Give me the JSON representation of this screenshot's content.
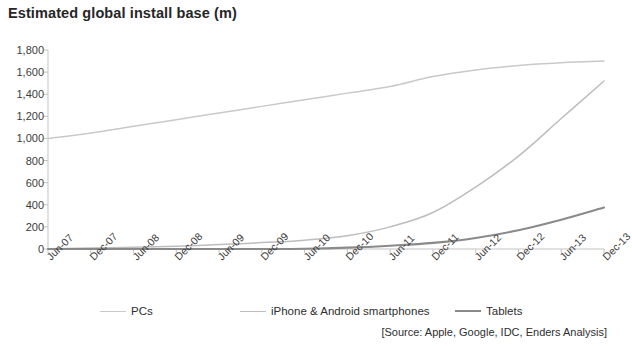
{
  "chart_data": {
    "type": "line",
    "title": "Estimated global install base (m)",
    "xlabel": "",
    "ylabel": "",
    "ylim": [
      0,
      1800
    ],
    "ytick_step": 200,
    "ytick_labels": [
      "1,800",
      "1,600",
      "1,400",
      "1,200",
      "1,000",
      "800",
      "600",
      "400",
      "200",
      "0"
    ],
    "ytick_values": [
      1800,
      1600,
      1400,
      1200,
      1000,
      800,
      600,
      400,
      200,
      0
    ],
    "grid": false,
    "legend_position": "bottom",
    "x": [
      "Jun-07",
      "Dec-07",
      "Jun-08",
      "Dec-08",
      "Jun-09",
      "Dec-09",
      "Jun-10",
      "Dec-10",
      "Jun-11",
      "Dec-11",
      "Jun-12",
      "Dec-12",
      "Jun-13",
      "Dec-13"
    ],
    "series": [
      {
        "name": "PCs",
        "color": "#c9c9c9",
        "values": [
          1000,
          1050,
          1110,
          1170,
          1230,
          1290,
          1350,
          1410,
          1470,
          1560,
          1620,
          1660,
          1685,
          1700
        ]
      },
      {
        "name": "iPhone & Android smartphones",
        "color": "#bdbdbd",
        "values": [
          3,
          8,
          16,
          26,
          40,
          58,
          80,
          120,
          200,
          330,
          560,
          840,
          1180,
          1520
        ]
      },
      {
        "name": "Tablets",
        "color": "#8a8a8a",
        "values": [
          0,
          0,
          0,
          0,
          0,
          0,
          2,
          12,
          30,
          55,
          100,
          170,
          265,
          375
        ]
      }
    ],
    "source": "[Source: Apple, Google, IDC, Enders Analysis]",
    "axis_color": "#c3c3c3"
  },
  "legend": {
    "items": [
      {
        "label": "PCs"
      },
      {
        "label": "iPhone & Android smartphones"
      },
      {
        "label": "Tablets"
      }
    ]
  }
}
